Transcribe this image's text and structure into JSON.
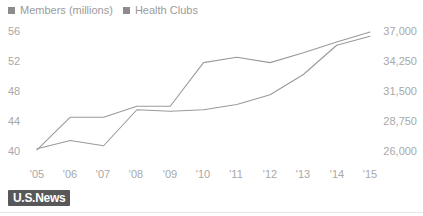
{
  "legend": {
    "position": "top-left",
    "swatch_color": "#8c8c8c",
    "items": [
      {
        "label": "Members (millions)",
        "marker": "square-marker-icon"
      },
      {
        "label": "Health Clubs",
        "marker": "square-marker-icon"
      }
    ]
  },
  "axis": {
    "left_ticks": [
      "56",
      "52",
      "48",
      "44",
      "40"
    ],
    "right_ticks": [
      "37,000",
      "34,250",
      "31,500",
      "28,750",
      "26,000"
    ],
    "x_ticks": [
      "'05",
      "'06",
      "'07",
      "'08",
      "'09",
      "'10",
      "'11",
      "'12",
      "'13",
      "'14",
      "'15"
    ]
  },
  "footer": {
    "logo_text": "U.S.News",
    "logo_background": "#58585a"
  },
  "chart_data": {
    "type": "line",
    "title": "",
    "subtitle": "",
    "xlabel": "",
    "ylabel": "Members (millions)",
    "y2label": "Health Clubs",
    "grid": false,
    "legend_position": "top-left",
    "line_color": "#9a9a9a",
    "categories": [
      "'05",
      "'06",
      "'07",
      "'08",
      "'09",
      "'10",
      "'11",
      "'12",
      "'13",
      "'14",
      "'15"
    ],
    "ylim": [
      38,
      58
    ],
    "ytick_values": [
      56,
      52,
      48,
      44,
      40
    ],
    "y2lim": [
      24625,
      38375
    ],
    "y2tick_values": [
      37000,
      34250,
      31500,
      28750,
      26000
    ],
    "series": [
      {
        "name": "Members (millions)",
        "axis": "left",
        "values": [
          40.3,
          41.4,
          40.7,
          45.5,
          45.3,
          45.5,
          46.2,
          47.5,
          50.2,
          54.1,
          55.3
        ]
      },
      {
        "name": "Health Clubs",
        "axis": "right",
        "values": [
          26100,
          29100,
          29100,
          30100,
          30100,
          34100,
          34600,
          34100,
          35000,
          36000,
          36900
        ]
      }
    ]
  }
}
